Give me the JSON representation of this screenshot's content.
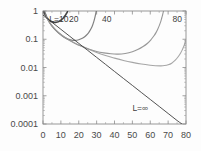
{
  "chart_data": {
    "type": "line",
    "title": "",
    "subtitle": "",
    "xlabel": "",
    "ylabel": "",
    "xscale": "linear",
    "yscale": "log",
    "xlim": [
      0,
      80
    ],
    "ylim": [
      0.0001,
      1
    ],
    "grid": false,
    "legend_position": "inline-labels",
    "x_ticks": [
      "0",
      "10",
      "20",
      "30",
      "40",
      "50",
      "60",
      "70",
      "80"
    ],
    "x_tick_values": [
      0,
      10,
      20,
      30,
      40,
      50,
      60,
      70,
      80
    ],
    "y_ticks": [
      "1",
      "0.1",
      "0.01",
      "0.001",
      "0.0001"
    ],
    "y_tick_values": [
      1,
      0.1,
      0.01,
      0.001,
      0.0001
    ],
    "annotations": [
      {
        "text": "L=10",
        "x": 3.5,
        "y": 1.55,
        "name": "curve-label-l10"
      },
      {
        "text": "20",
        "x": 14.5,
        "y": 1.55,
        "name": "curve-label-l20"
      },
      {
        "text": "40",
        "x": 33.0,
        "y": 1.55,
        "name": "curve-label-l40"
      },
      {
        "text": "80",
        "x": 72.5,
        "y": 1.55,
        "name": "curve-label-l80"
      },
      {
        "text": "L=∞",
        "x": 50.0,
        "y": 0.0003,
        "name": "curve-label-linfinity"
      }
    ],
    "series": [
      {
        "name": "L=10",
        "label": "L=10",
        "color": "#2b2b2b",
        "width": 1.6,
        "points": [
          [
            0.6,
            0.92
          ],
          [
            1.2,
            0.74
          ],
          [
            1.8,
            0.63
          ],
          [
            2.5,
            0.55
          ],
          [
            3.2,
            0.49
          ],
          [
            4.0,
            0.45
          ],
          [
            5.0,
            0.42
          ],
          [
            6.0,
            0.4
          ],
          [
            7.0,
            0.395
          ],
          [
            8.0,
            0.405
          ],
          [
            9.0,
            0.43
          ],
          [
            10.0,
            0.47
          ],
          [
            10.8,
            0.52
          ],
          [
            11.5,
            0.58
          ],
          [
            12.2,
            0.66
          ],
          [
            12.8,
            0.75
          ],
          [
            13.3,
            0.85
          ],
          [
            13.7,
            0.95
          ]
        ]
      },
      {
        "name": "L=20",
        "label": "20",
        "color": "#6f6f6f",
        "width": 1.2,
        "points": [
          [
            1.0,
            0.95
          ],
          [
            2.0,
            0.62
          ],
          [
            3.0,
            0.46
          ],
          [
            4.5,
            0.33
          ],
          [
            6.0,
            0.25
          ],
          [
            8.0,
            0.185
          ],
          [
            10.0,
            0.145
          ],
          [
            12.0,
            0.118
          ],
          [
            14.0,
            0.101
          ],
          [
            16.0,
            0.093
          ],
          [
            18.0,
            0.091
          ],
          [
            20.0,
            0.096
          ],
          [
            22.0,
            0.108
          ],
          [
            23.5,
            0.125
          ],
          [
            25.0,
            0.155
          ],
          [
            26.0,
            0.19
          ],
          [
            27.0,
            0.245
          ],
          [
            27.8,
            0.32
          ],
          [
            28.4,
            0.42
          ],
          [
            28.9,
            0.55
          ],
          [
            29.3,
            0.7
          ],
          [
            29.6,
            0.86
          ],
          [
            29.8,
            0.98
          ]
        ]
      },
      {
        "name": "L=40",
        "label": "40",
        "color": "#8a8a8a",
        "width": 1.1,
        "points": [
          [
            1.5,
            0.78
          ],
          [
            3.0,
            0.46
          ],
          [
            5.0,
            0.29
          ],
          [
            8.0,
            0.185
          ],
          [
            11.0,
            0.128
          ],
          [
            14.0,
            0.098
          ],
          [
            18.0,
            0.071
          ],
          [
            22.0,
            0.055
          ],
          [
            26.0,
            0.044
          ],
          [
            30.0,
            0.037
          ],
          [
            34.0,
            0.033
          ],
          [
            38.0,
            0.0305
          ],
          [
            42.0,
            0.0298
          ],
          [
            46.0,
            0.0315
          ],
          [
            50.0,
            0.036
          ],
          [
            53.0,
            0.043
          ],
          [
            56.0,
            0.055
          ],
          [
            58.5,
            0.072
          ],
          [
            60.5,
            0.098
          ],
          [
            62.0,
            0.13
          ],
          [
            63.3,
            0.175
          ],
          [
            64.3,
            0.235
          ],
          [
            65.1,
            0.31
          ],
          [
            65.8,
            0.41
          ],
          [
            66.3,
            0.53
          ],
          [
            66.8,
            0.69
          ],
          [
            67.2,
            0.87
          ],
          [
            67.4,
            0.99
          ]
        ]
      },
      {
        "name": "L=80",
        "label": "80",
        "color": "#9a9a9a",
        "width": 1.1,
        "points": [
          [
            2.0,
            0.6
          ],
          [
            4.0,
            0.36
          ],
          [
            7.0,
            0.215
          ],
          [
            11.0,
            0.133
          ],
          [
            15.0,
            0.091
          ],
          [
            20.0,
            0.062
          ],
          [
            25.0,
            0.045
          ],
          [
            30.0,
            0.034
          ],
          [
            35.0,
            0.0265
          ],
          [
            40.0,
            0.0215
          ],
          [
            45.0,
            0.0178
          ],
          [
            50.0,
            0.0152
          ],
          [
            55.0,
            0.0133
          ],
          [
            60.0,
            0.01205
          ],
          [
            63.0,
            0.0116
          ],
          [
            66.0,
            0.01145
          ],
          [
            68.0,
            0.0117
          ],
          [
            70.0,
            0.01245
          ],
          [
            72.0,
            0.0142
          ],
          [
            74.0,
            0.0182
          ],
          [
            75.5,
            0.0235
          ],
          [
            77.0,
            0.0325
          ],
          [
            78.0,
            0.0435
          ],
          [
            79.0,
            0.061
          ],
          [
            79.7,
            0.082
          ],
          [
            80.0,
            0.098
          ]
        ]
      },
      {
        "name": "L=infinity",
        "label": "L=∞",
        "color": "#3a3a3a",
        "width": 1.0,
        "points": [
          [
            0.0,
            0.72
          ],
          [
            5.0,
            0.4
          ],
          [
            10.0,
            0.225
          ],
          [
            15.0,
            0.127
          ],
          [
            20.0,
            0.0715
          ],
          [
            25.0,
            0.0405
          ],
          [
            30.0,
            0.0228
          ],
          [
            35.0,
            0.0129
          ],
          [
            40.0,
            0.00725
          ],
          [
            45.0,
            0.0041
          ],
          [
            50.0,
            0.00232
          ],
          [
            55.0,
            0.00131
          ],
          [
            60.0,
            0.00074
          ],
          [
            65.0,
            0.000418
          ],
          [
            70.0,
            0.000236
          ],
          [
            75.0,
            0.000133
          ],
          [
            80.0,
            7.9e-05
          ]
        ]
      }
    ]
  },
  "plot_frame": {
    "left": 43,
    "right": 186,
    "top": 11,
    "bottom": 124
  }
}
